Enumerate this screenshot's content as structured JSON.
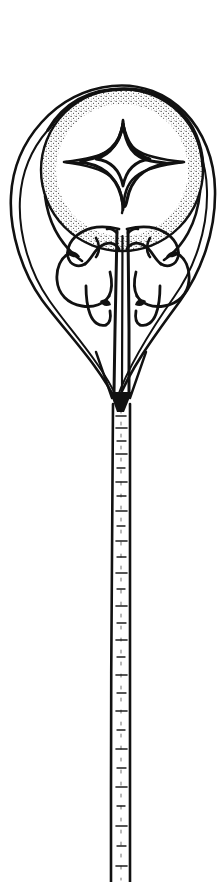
{
  "figure": {
    "background_color": "#ffffff",
    "ink_color": "#111111",
    "title": "",
    "caption": "",
    "style": "pen-and-ink stipple line drawing",
    "canvas": {
      "width": 224,
      "height": 882
    },
    "parts": [
      {
        "name": "pin-head-outer-teardrop",
        "label": "Outer pear-shaped head outline",
        "description": "Double-line teardrop contour enclosing the circular field and tapering to the shaft",
        "bounds": {
          "x": 8,
          "y": 84,
          "width": 208,
          "height": 320
        }
      },
      {
        "name": "pin-head-inner-circle",
        "label": "Inner circular field",
        "description": "Stippled circular band framing the central star motif",
        "center": {
          "x": 122,
          "y": 170
        },
        "radius": 82
      },
      {
        "name": "four-pointed-star",
        "label": "Four-pointed star motif",
        "description": "Concave-sided four-pointed star at the centre of the circular field",
        "center": {
          "x": 123,
          "y": 164
        },
        "radius_x": 42,
        "radius_y": 40,
        "points": 4
      },
      {
        "name": "knotwork-left",
        "label": "Left zoomorphic knot",
        "description": "Interlaced ribbon / animal form in the left lower lobe",
        "bounds": {
          "x": 55,
          "y": 224,
          "width": 68,
          "height": 96
        }
      },
      {
        "name": "knotwork-right",
        "label": "Right zoomorphic knot",
        "description": "Mirrored interlaced ribbon / animal form in the right lower lobe",
        "bounds": {
          "x": 123,
          "y": 224,
          "width": 68,
          "height": 96
        }
      },
      {
        "name": "central-spine",
        "label": "Central dividing spine",
        "description": "Paired vertical lines running down between the two knots into the shaft",
        "bounds": {
          "x": 112,
          "y": 232,
          "width": 22,
          "height": 175
        }
      },
      {
        "name": "pin-shaft",
        "label": "Pin shaft",
        "description": "Long tapering shaft running from the head to the bottom edge of the image",
        "bounds": {
          "x": 110,
          "y": 400,
          "width": 12,
          "height": 482
        }
      }
    ],
    "geometry": {
      "head_top_y": 84,
      "head_widest_y": 176,
      "head_left_x": 8,
      "head_right_x": 216,
      "taper_join_y": 400,
      "shaft_bottom_y": 882,
      "shaft_top_width": 11,
      "shaft_bottom_width": 7
    }
  }
}
